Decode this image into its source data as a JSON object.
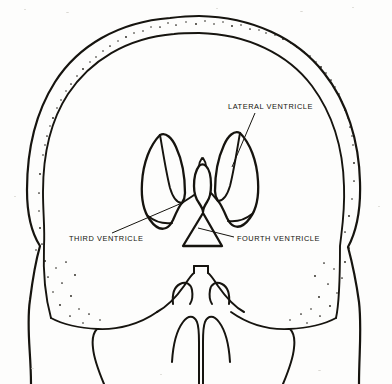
{
  "figure": {
    "view": "coronal",
    "background_color": "#fdfdfc",
    "ink_color": "#16140f"
  },
  "labels": [
    {
      "id": "lateral-ventricle",
      "text": "LATERAL VENTRICLE",
      "text_anchor": "start",
      "x": 228,
      "y": 109,
      "leader": {
        "x1": 255,
        "y1": 113,
        "x2": 232,
        "y2": 167
      }
    },
    {
      "id": "third-ventricle",
      "text": "THIRD VENTRICLE",
      "text_anchor": "start",
      "x": 69,
      "y": 241,
      "leader": {
        "x1": 112,
        "y1": 233,
        "x2": 182,
        "y2": 203
      }
    },
    {
      "id": "fourth-ventricle",
      "text": "FOURTH VENTRICLE",
      "text_anchor": "start",
      "x": 237,
      "y": 241,
      "leader": {
        "x1": 234,
        "y1": 237,
        "x2": 198,
        "y2": 228
      }
    }
  ],
  "structures": [
    {
      "id": "cranial-vault-outer",
      "name": "outer table of skull"
    },
    {
      "id": "cranial-vault-inner",
      "name": "inner table of skull"
    },
    {
      "id": "diploe-stipple",
      "name": "diploic bone stippling"
    },
    {
      "id": "left-lateral-ventricle",
      "name": "left lateral ventricle"
    },
    {
      "id": "right-lateral-ventricle",
      "name": "right lateral ventricle"
    },
    {
      "id": "third-ventricle-body",
      "name": "third ventricle"
    },
    {
      "id": "fourth-ventricle-body",
      "name": "fourth ventricle"
    },
    {
      "id": "skull-base",
      "name": "skull base and facial bones"
    },
    {
      "id": "nasal-septum",
      "name": "nasal septum"
    },
    {
      "id": "left-nasal-concha",
      "name": "left nasal concha"
    },
    {
      "id": "right-nasal-concha",
      "name": "right nasal concha"
    },
    {
      "id": "left-temporal-process",
      "name": "left temporal / zygomatic process"
    },
    {
      "id": "right-temporal-process",
      "name": "right temporal / zygomatic process"
    }
  ]
}
